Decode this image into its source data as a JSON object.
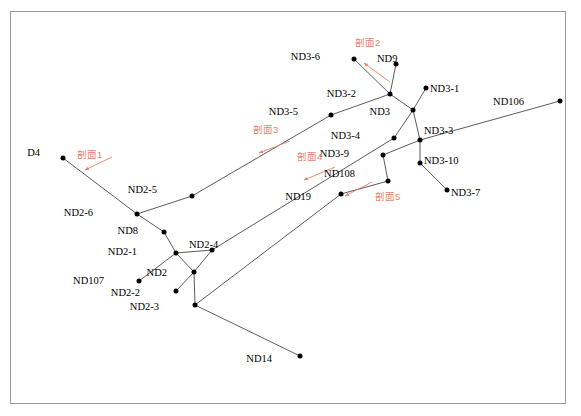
{
  "diagram": {
    "frame_color": "#9a9a9a",
    "node_color": "#000000",
    "edge_color": "#4a4a4a",
    "annotation_color": "#e8806a",
    "nodes": [
      {
        "id": "D4",
        "label": "D4",
        "x": 63,
        "y": 158,
        "lx": 40,
        "ly": 148,
        "anchor": "right"
      },
      {
        "id": "ND2-6",
        "label": "ND2-6",
        "x": 137,
        "y": 214,
        "lx": 93,
        "ly": 208,
        "anchor": "right"
      },
      {
        "id": "ND2-5",
        "label": "ND2-5",
        "x": 192,
        "y": 196,
        "lx": 157,
        "ly": 185,
        "anchor": "right"
      },
      {
        "id": "ND8",
        "label": "ND8",
        "x": 164,
        "y": 232,
        "lx": 138,
        "ly": 226,
        "anchor": "right"
      },
      {
        "id": "ND2-1",
        "label": "ND2-1",
        "x": 176,
        "y": 253,
        "lx": 137,
        "ly": 247,
        "anchor": "right"
      },
      {
        "id": "ND2-4",
        "label": "ND2-4",
        "x": 212,
        "y": 250,
        "lx": 189,
        "ly": 240,
        "anchor": "left"
      },
      {
        "id": "ND2",
        "label": "ND2",
        "x": 194,
        "y": 272,
        "lx": 167,
        "ly": 268,
        "anchor": "right"
      },
      {
        "id": "ND107",
        "label": "ND107",
        "x": 139,
        "y": 281,
        "lx": 104,
        "ly": 276,
        "anchor": "right"
      },
      {
        "id": "ND2-2",
        "label": "ND2-2",
        "x": 176,
        "y": 291,
        "lx": 140,
        "ly": 288,
        "anchor": "right"
      },
      {
        "id": "ND2-3",
        "label": "ND2-3",
        "x": 195,
        "y": 305,
        "lx": 159,
        "ly": 302,
        "anchor": "right"
      },
      {
        "id": "ND14",
        "label": "ND14",
        "x": 300,
        "y": 356,
        "lx": 272,
        "ly": 354,
        "anchor": "right"
      },
      {
        "id": "ND3-5",
        "label": "ND3-5",
        "x": 331,
        "y": 115,
        "lx": 298,
        "ly": 107,
        "anchor": "right"
      },
      {
        "id": "ND3-6",
        "label": "ND3-6",
        "x": 354,
        "y": 59,
        "lx": 320,
        "ly": 52,
        "anchor": "right"
      },
      {
        "id": "ND9",
        "label": "ND9",
        "x": 396,
        "y": 64,
        "lx": 377,
        "ly": 54,
        "anchor": "left"
      },
      {
        "id": "ND3-2",
        "label": "ND3-2",
        "x": 390,
        "y": 94,
        "lx": 356,
        "ly": 89,
        "anchor": "right"
      },
      {
        "id": "ND3",
        "label": "ND3",
        "x": 413,
        "y": 110,
        "lx": 390,
        "ly": 107,
        "anchor": "right"
      },
      {
        "id": "ND3-1",
        "label": "ND3-1",
        "x": 426,
        "y": 88,
        "lx": 430,
        "ly": 84,
        "anchor": "left"
      },
      {
        "id": "ND3-3",
        "label": "ND3-3",
        "x": 420,
        "y": 140,
        "lx": 424,
        "ly": 126,
        "anchor": "left"
      },
      {
        "id": "ND3-4",
        "label": "ND3-4",
        "x": 394,
        "y": 138,
        "lx": 360,
        "ly": 131,
        "anchor": "right"
      },
      {
        "id": "ND3-9",
        "label": "ND3-9",
        "x": 383,
        "y": 155,
        "lx": 349,
        "ly": 149,
        "anchor": "right"
      },
      {
        "id": "ND3-10",
        "label": "ND3-10",
        "x": 420,
        "y": 163,
        "lx": 424,
        "ly": 156,
        "anchor": "left"
      },
      {
        "id": "ND3-7",
        "label": "ND3-7",
        "x": 447,
        "y": 190,
        "lx": 451,
        "ly": 188,
        "anchor": "left"
      },
      {
        "id": "ND108",
        "label": "ND108",
        "x": 388,
        "y": 181,
        "lx": 355,
        "ly": 169,
        "anchor": "right"
      },
      {
        "id": "ND19",
        "label": "ND19",
        "x": 341,
        "y": 194,
        "lx": 311,
        "ly": 192,
        "anchor": "right"
      },
      {
        "id": "ND106",
        "label": "ND106",
        "x": 560,
        "y": 101,
        "lx": 524,
        "ly": 97,
        "anchor": "right"
      }
    ],
    "edges": [
      {
        "from": "D4",
        "to": "ND2-6"
      },
      {
        "from": "ND2-6",
        "to": "ND2-5"
      },
      {
        "from": "ND2-6",
        "to": "ND8"
      },
      {
        "from": "ND8",
        "to": "ND2-1"
      },
      {
        "from": "ND2-1",
        "to": "ND2-4"
      },
      {
        "from": "ND2-1",
        "to": "ND107"
      },
      {
        "from": "ND2-1",
        "to": "ND2"
      },
      {
        "from": "ND2",
        "to": "ND2-4"
      },
      {
        "from": "ND2",
        "to": "ND2-2"
      },
      {
        "from": "ND2",
        "to": "ND2-3"
      },
      {
        "from": "ND2-3",
        "to": "ND14"
      },
      {
        "from": "ND2-5",
        "to": "ND3-5"
      },
      {
        "from": "ND3-5",
        "to": "ND3-2"
      },
      {
        "from": "ND3-6",
        "to": "ND3-2"
      },
      {
        "from": "ND9",
        "to": "ND3-2"
      },
      {
        "from": "ND3-2",
        "to": "ND3"
      },
      {
        "from": "ND3",
        "to": "ND3-1"
      },
      {
        "from": "ND3",
        "to": "ND3-3"
      },
      {
        "from": "ND3",
        "to": "ND3-4"
      },
      {
        "from": "ND3-4",
        "to": "ND2-4"
      },
      {
        "from": "ND3-3",
        "to": "ND106"
      },
      {
        "from": "ND3-3",
        "to": "ND3-10"
      },
      {
        "from": "ND3-10",
        "to": "ND3-7"
      },
      {
        "from": "ND3-3",
        "to": "ND3-9"
      },
      {
        "from": "ND3-9",
        "to": "ND108"
      },
      {
        "from": "ND108",
        "to": "ND19"
      },
      {
        "from": "ND19",
        "to": "ND2-3"
      }
    ],
    "sections": [
      {
        "id": "sec1",
        "label": "剖面1",
        "lx": 77,
        "ly": 150,
        "ax1": 112,
        "ay1": 157,
        "ax2": 85,
        "ay2": 170
      },
      {
        "id": "sec2",
        "label": "剖面2",
        "lx": 355,
        "ly": 38,
        "ax1": 390,
        "ay1": 82,
        "ax2": 364,
        "ay2": 63
      },
      {
        "id": "sec3",
        "label": "剖面3",
        "lx": 253,
        "ly": 125,
        "ax1": 290,
        "ay1": 141,
        "ax2": 259,
        "ay2": 153
      },
      {
        "id": "sec4",
        "label": "剖面4",
        "lx": 297,
        "ly": 152,
        "ax1": 335,
        "ay1": 167,
        "ax2": 304,
        "ay2": 180
      },
      {
        "id": "sec5",
        "label": "剖面5",
        "lx": 375,
        "ly": 192,
        "ax1": 372,
        "ay1": 182,
        "ax2": 345,
        "ay2": 196
      }
    ]
  }
}
